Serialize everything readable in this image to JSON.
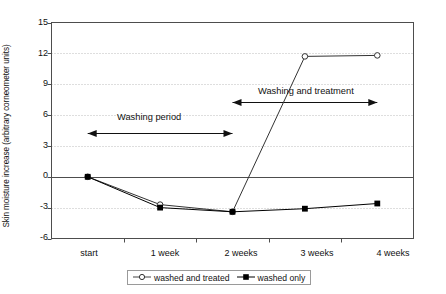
{
  "chart_data": {
    "type": "line",
    "title": "",
    "xlabel": "",
    "ylabel": "Skin moisture increase (arbitrary corneometer units)",
    "categories": [
      "start",
      "1 week",
      "2 weeks",
      "3 weeks",
      "4 weeks"
    ],
    "ylim": [
      -6,
      15
    ],
    "yticks": [
      "-6",
      "-3",
      "0",
      "3",
      "6",
      "9",
      "12",
      "15"
    ],
    "ytick_values": [
      -6,
      -3,
      0,
      3,
      6,
      9,
      12,
      15
    ],
    "grid": "horizontal-dotted",
    "legend_position": "bottom-center",
    "series": [
      {
        "name": "washed and treated",
        "marker": "open-circle",
        "color": "#333333",
        "values": [
          0,
          -2.7,
          -3.4,
          11.7,
          11.8
        ]
      },
      {
        "name": "washed only",
        "marker": "filled-square",
        "color": "#000000",
        "values": [
          0,
          -3.0,
          -3.4,
          -3.1,
          -2.6
        ]
      }
    ],
    "annotations": [
      {
        "id": "washing-period",
        "text": "Washing period",
        "arrow": "double-headed",
        "from_category": "start",
        "to_category": "2 weeks",
        "y_value": 4.3
      },
      {
        "id": "washing-and-treatment",
        "text": "Washing and treatment",
        "arrow": "double-headed",
        "from_category": "2 weeks",
        "to_category": "4 weeks",
        "y_value": 7.3
      }
    ]
  },
  "legend": {
    "items": [
      {
        "label": "washed and treated",
        "marker": "open-circle"
      },
      {
        "label": "washed only",
        "marker": "filled-square"
      }
    ]
  },
  "colors": {
    "axis": "#4d4d4d",
    "grid": "#bdbdbd",
    "zero_line": "#4d4d4d",
    "series_treated": "#444444",
    "series_washed": "#000000",
    "annotation": "#111111",
    "background": "#ffffff"
  }
}
